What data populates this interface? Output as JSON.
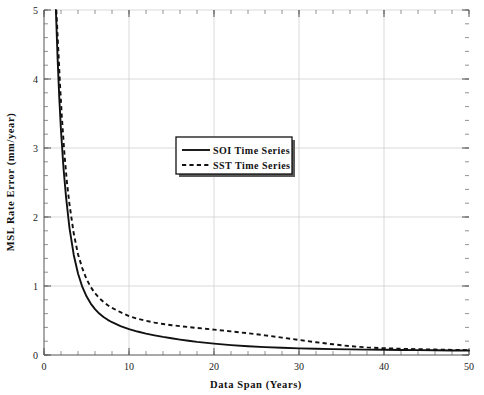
{
  "chart_data": {
    "type": "line",
    "title": "",
    "xlabel": "Data Span (Years)",
    "ylabel": "MSL Rate Error (mm/year)",
    "xlim": [
      0,
      50
    ],
    "ylim": [
      0,
      5
    ],
    "xticks": [
      0,
      10,
      20,
      30,
      40,
      50
    ],
    "xtick_labels": [
      "0",
      "10",
      "20",
      "30",
      "40",
      "50"
    ],
    "yticks": [
      0,
      1,
      2,
      3,
      4,
      5
    ],
    "ytick_labels": [
      "0",
      "1",
      "2",
      "3",
      "4",
      "5"
    ],
    "x_minor_step": 2,
    "y_minor_step": 0.2,
    "grid": true,
    "legend_position": "upper-center",
    "series": [
      {
        "name": "SOI Time Series",
        "style": "solid",
        "color": "#111111",
        "x": [
          1.4,
          1.6,
          1.8,
          2.0,
          2.3,
          2.6,
          3.0,
          3.5,
          4.0,
          4.5,
          5.0,
          5.5,
          6.0,
          6.5,
          7.0,
          7.5,
          8.0,
          9.0,
          10.0,
          11.0,
          12.0,
          13.0,
          14.0,
          15.0,
          16.0,
          17.0,
          18.0,
          20.0,
          22.0,
          24.0,
          26.0,
          28.0,
          30.0,
          32.0,
          34.0,
          36.0,
          38.0,
          40.0,
          42.0,
          44.0,
          46.0,
          48.0,
          50.0
        ],
        "y": [
          5.0,
          4.3,
          3.72,
          3.25,
          2.7,
          2.28,
          1.84,
          1.45,
          1.18,
          0.99,
          0.85,
          0.745,
          0.665,
          0.6,
          0.55,
          0.51,
          0.475,
          0.42,
          0.375,
          0.34,
          0.31,
          0.285,
          0.262,
          0.242,
          0.223,
          0.206,
          0.19,
          0.164,
          0.143,
          0.127,
          0.114,
          0.104,
          0.096,
          0.09,
          0.085,
          0.081,
          0.078,
          0.075,
          0.072,
          0.07,
          0.068,
          0.066,
          0.065
        ]
      },
      {
        "name": "SST Time Series",
        "style": "dashed",
        "color": "#111111",
        "x": [
          1.45,
          1.7,
          1.9,
          2.1,
          2.4,
          2.7,
          3.0,
          3.5,
          4.0,
          4.5,
          5.0,
          5.5,
          6.0,
          6.5,
          7.0,
          7.5,
          8.0,
          9.0,
          10.0,
          11.0,
          12.0,
          13.0,
          14.0,
          15.0,
          16.0,
          17.0,
          18.0,
          20.0,
          22.0,
          24.0,
          26.0,
          28.0,
          30.0,
          32.0,
          34.0,
          36.0,
          38.0,
          40.0,
          42.0,
          44.0,
          46.0,
          48.0,
          50.0
        ],
        "y": [
          5.0,
          4.38,
          3.88,
          3.45,
          2.92,
          2.5,
          2.18,
          1.76,
          1.46,
          1.26,
          1.1,
          0.985,
          0.895,
          0.825,
          0.77,
          0.722,
          0.683,
          0.62,
          0.565,
          0.525,
          0.495,
          0.47,
          0.45,
          0.432,
          0.418,
          0.405,
          0.392,
          0.368,
          0.342,
          0.315,
          0.285,
          0.252,
          0.218,
          0.185,
          0.155,
          0.128,
          0.11,
          0.098,
          0.09,
          0.084,
          0.079,
          0.074,
          0.07
        ]
      }
    ],
    "legend": [
      {
        "label": "SOI Time Series",
        "style": "solid"
      },
      {
        "label": "SST Time Series",
        "style": "dashed"
      }
    ]
  }
}
